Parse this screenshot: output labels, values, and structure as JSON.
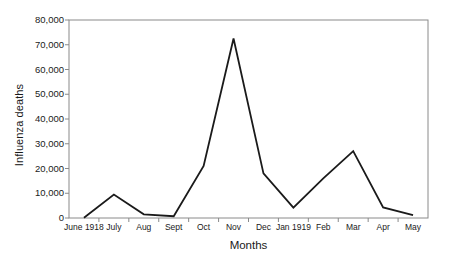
{
  "chart_data": {
    "type": "line",
    "title": "",
    "xlabel": "Months",
    "ylabel": "Influenza deaths",
    "categories": [
      "June 1918",
      "July",
      "Aug",
      "Sept",
      "Oct",
      "Nov",
      "Dec",
      "Jan 1919",
      "Feb",
      "Mar",
      "Apr",
      "May"
    ],
    "values": [
      100,
      9500,
      1500,
      700,
      21000,
      72500,
      18000,
      4200,
      16000,
      27000,
      4300,
      1200
    ],
    "series": [
      {
        "name": "Influenza deaths",
        "values": [
          100,
          9500,
          1500,
          700,
          21000,
          72500,
          18000,
          4200,
          16000,
          27000,
          4300,
          1200
        ]
      }
    ],
    "ylim": [
      0,
      80000
    ],
    "y_ticks": [
      0,
      10000,
      20000,
      30000,
      40000,
      50000,
      60000,
      70000,
      80000
    ],
    "y_tick_labels": [
      "0",
      "10,000",
      "20,000",
      "30,000",
      "40,000",
      "50,000",
      "60,000",
      "70,000",
      "80,000"
    ],
    "grid": false,
    "legend": false,
    "legend_position": "none",
    "line_color": "#1a1a1a",
    "axis_color": "#8a8a8a",
    "background_color": "#ffffff",
    "markers": false
  }
}
